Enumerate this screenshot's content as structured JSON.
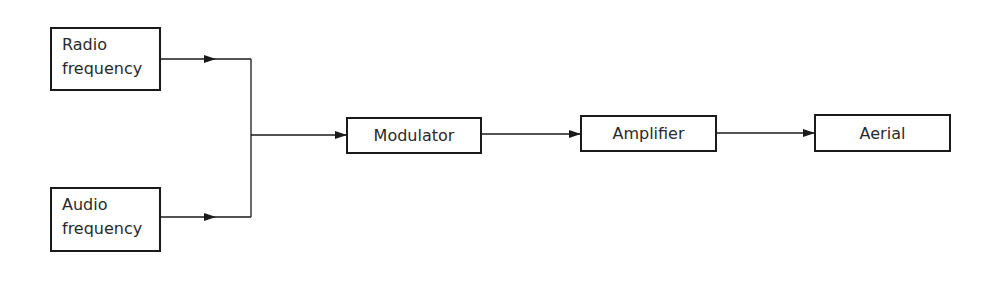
{
  "diagram": {
    "inputs": [
      {
        "id": "radio",
        "lines": [
          "Radio",
          "frequency"
        ]
      },
      {
        "id": "audio",
        "lines": [
          "Audio",
          "frequency"
        ]
      }
    ],
    "blocks": [
      {
        "id": "modulator",
        "label": "Modulator"
      },
      {
        "id": "amplifier",
        "label": "Amplifier"
      },
      {
        "id": "aerial",
        "label": "Aerial"
      }
    ],
    "connections": [
      {
        "from": "radio",
        "to": "modulator"
      },
      {
        "from": "audio",
        "to": "modulator"
      },
      {
        "from": "modulator",
        "to": "amplifier"
      },
      {
        "from": "amplifier",
        "to": "aerial"
      }
    ],
    "colors": {
      "line": "#1a1a1a",
      "text": "#2a2a2a",
      "background": "#ffffff"
    }
  }
}
